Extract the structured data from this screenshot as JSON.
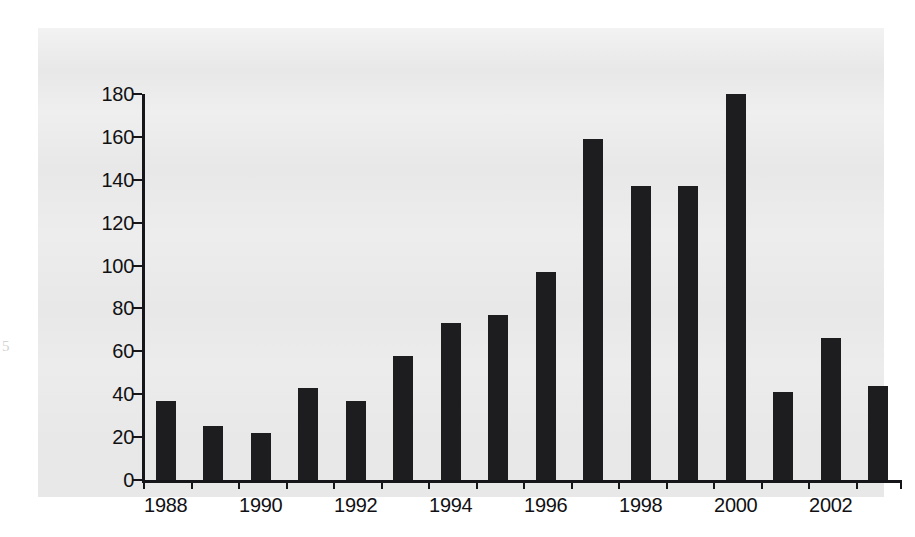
{
  "margin_mark": "5",
  "chart_data": {
    "type": "bar",
    "title": "",
    "xlabel": "",
    "ylabel": "",
    "ylim": [
      0,
      180
    ],
    "xlim_years": [
      1988,
      2003
    ],
    "grid": false,
    "legend": null,
    "bar_color": "#1d1d20",
    "panel_color": "#e8e8e8",
    "axis_color": "#16161a",
    "y_ticks": [
      0,
      20,
      40,
      60,
      80,
      100,
      120,
      140,
      160,
      180
    ],
    "y_tick_labels": [
      "0",
      "20",
      "40",
      "60",
      "80",
      "100",
      "120",
      "140",
      "160",
      "180"
    ],
    "x_ticks": [
      1988,
      1989,
      1990,
      1991,
      1992,
      1993,
      1994,
      1995,
      1996,
      1997,
      1998,
      1999,
      2000,
      2001,
      2002,
      2003
    ],
    "x_tick_labels_shown": [
      "1988",
      "",
      "1990",
      "",
      "1992",
      "",
      "1994",
      "",
      "1996",
      "",
      "1998",
      "",
      "2000",
      "",
      "2002",
      ""
    ],
    "categories": [
      "1988",
      "1989",
      "1990",
      "1991",
      "1992",
      "1993",
      "1994",
      "1995",
      "1996",
      "1997",
      "1998",
      "1999",
      "2000",
      "2001",
      "2002",
      "2003"
    ],
    "values": [
      37,
      25,
      22,
      43,
      37,
      58,
      73,
      77,
      97,
      159,
      137,
      137,
      180,
      41,
      66,
      44
    ]
  }
}
